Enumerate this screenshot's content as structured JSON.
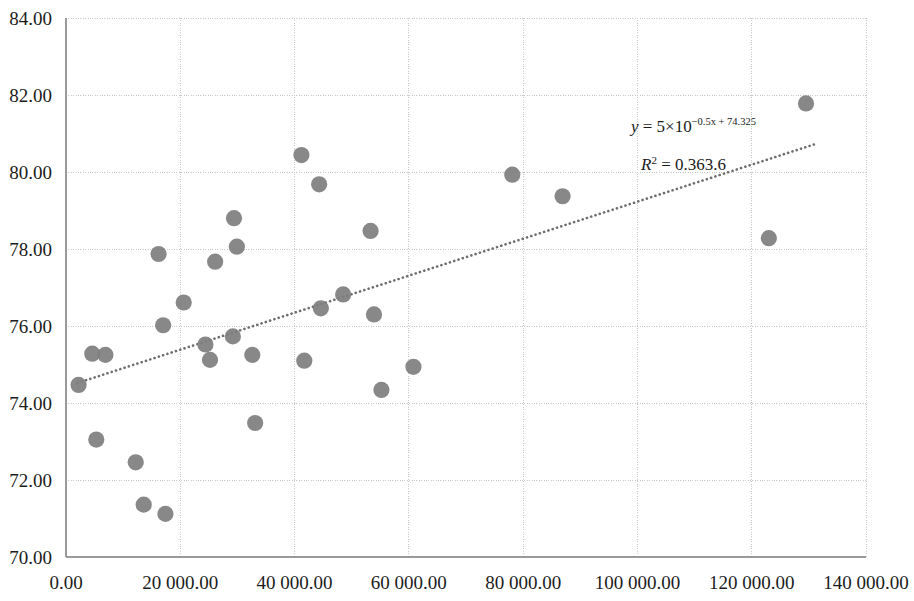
{
  "chart_data": {
    "type": "scatter",
    "title": "",
    "subtitle": "",
    "xlabel": "",
    "ylabel": "",
    "xlim": [
      0,
      140000
    ],
    "ylim": [
      70.0,
      84.0
    ],
    "grid": true,
    "legend": false,
    "legend_position": "none",
    "x_tick_labels": [
      "0.00",
      "20 000.00",
      "40 000.00",
      "60 000.00",
      "80 000.00",
      "100 000.00",
      "120 000.00",
      "140 000.00"
    ],
    "x_tick_values": [
      0,
      20000,
      40000,
      60000,
      80000,
      100000,
      120000,
      140000
    ],
    "y_tick_labels": [
      "70.00",
      "72.00",
      "74.00",
      "76.00",
      "78.00",
      "80.00",
      "82.00",
      "84.00"
    ],
    "y_tick_values": [
      70,
      72,
      74,
      76,
      78,
      80,
      82,
      84
    ],
    "marker_color": "#7f7f7f",
    "marker_size": 9,
    "points": [
      {
        "x": 2200,
        "y": 74.47
      },
      {
        "x": 4600,
        "y": 75.28
      },
      {
        "x": 6900,
        "y": 75.25
      },
      {
        "x": 5300,
        "y": 73.05
      },
      {
        "x": 12200,
        "y": 72.46
      },
      {
        "x": 13600,
        "y": 71.36
      },
      {
        "x": 17400,
        "y": 71.12
      },
      {
        "x": 16200,
        "y": 77.87
      },
      {
        "x": 17000,
        "y": 76.02
      },
      {
        "x": 20600,
        "y": 76.61
      },
      {
        "x": 24400,
        "y": 75.52
      },
      {
        "x": 25200,
        "y": 75.12
      },
      {
        "x": 26100,
        "y": 77.67
      },
      {
        "x": 29400,
        "y": 78.8
      },
      {
        "x": 29900,
        "y": 78.06
      },
      {
        "x": 29200,
        "y": 75.73
      },
      {
        "x": 32600,
        "y": 75.25
      },
      {
        "x": 33100,
        "y": 73.48
      },
      {
        "x": 41200,
        "y": 80.44
      },
      {
        "x": 41700,
        "y": 75.1
      },
      {
        "x": 44300,
        "y": 79.68
      },
      {
        "x": 44600,
        "y": 76.46
      },
      {
        "x": 48500,
        "y": 76.82
      },
      {
        "x": 53300,
        "y": 78.47
      },
      {
        "x": 53900,
        "y": 76.3
      },
      {
        "x": 55200,
        "y": 74.34
      },
      {
        "x": 60800,
        "y": 74.94
      },
      {
        "x": 78100,
        "y": 79.93
      },
      {
        "x": 86900,
        "y": 79.37
      },
      {
        "x": 123000,
        "y": 78.28
      },
      {
        "x": 129500,
        "y": 81.78
      }
    ],
    "trendline": {
      "style": "dotted",
      "color": "#6e6e6e",
      "x_start": 2000,
      "y_start": 74.52,
      "x_end": 131000,
      "y_end": 80.72
    },
    "annotations": {
      "equation": {
        "lhs": "y",
        "equals": "=",
        "coefficient": "5",
        "times": "×",
        "base": "10",
        "exponent": "−0.5x + 74.325",
        "full_text": "y = 5×10^(−0.5x + 74.325)"
      },
      "r_squared": {
        "symbol": "R",
        "superscript": "2",
        "equals": "=",
        "value": "0.363.6",
        "full_text": "R² = 0.363.6"
      }
    }
  }
}
